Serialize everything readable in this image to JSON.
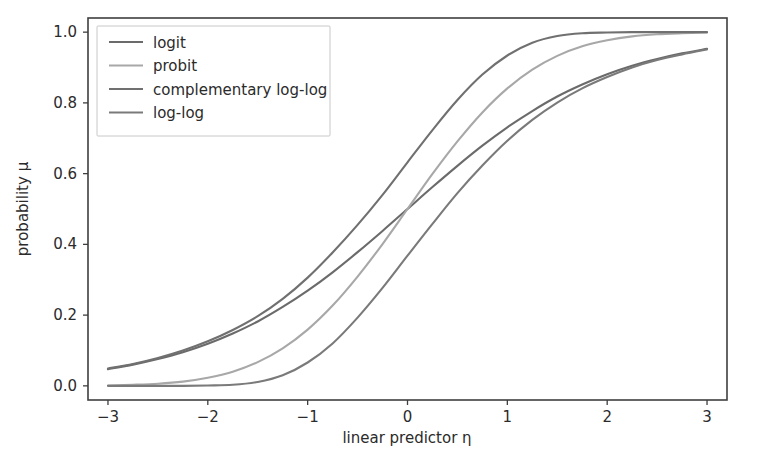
{
  "chart_data": {
    "type": "line",
    "title": "",
    "subtitle": "",
    "xlabel": "linear predictor η",
    "ylabel": "probability μ",
    "xlim": [
      -3.2,
      3.2
    ],
    "ylim": [
      -0.04,
      1.04
    ],
    "xticks": [
      -3,
      -2,
      -1,
      0,
      1,
      2,
      3
    ],
    "xticklabels": [
      "−3",
      "−2",
      "−1",
      "0",
      "1",
      "2",
      "3"
    ],
    "yticks": [
      0.0,
      0.2,
      0.4,
      0.6,
      0.8,
      1.0
    ],
    "yticklabels": [
      "0.0",
      "0.2",
      "0.4",
      "0.6",
      "0.8",
      "1.0"
    ],
    "grid": false,
    "legend_position": "upper left",
    "background": "#ffffff",
    "x": [
      -3.0,
      -2.75,
      -2.5,
      -2.25,
      -2.0,
      -1.75,
      -1.5,
      -1.25,
      -1.0,
      -0.75,
      -0.5,
      -0.25,
      0.0,
      0.25,
      0.5,
      0.75,
      1.0,
      1.25,
      1.5,
      1.75,
      2.0,
      2.25,
      2.5,
      2.75,
      3.0
    ],
    "series": [
      {
        "name": "logit",
        "color": "#6b6b6b",
        "link": "logit",
        "formula": "mu = 1 / (1 + exp(-eta))",
        "values": [
          0.047,
          0.06,
          0.076,
          0.095,
          0.119,
          0.148,
          0.182,
          0.223,
          0.269,
          0.321,
          0.378,
          0.438,
          0.5,
          0.562,
          0.622,
          0.679,
          0.731,
          0.777,
          0.818,
          0.852,
          0.881,
          0.905,
          0.924,
          0.94,
          0.953
        ]
      },
      {
        "name": "probit",
        "color": "#a8a8a8",
        "link": "probit",
        "formula": "mu = Phi(eta)",
        "values": [
          0.001,
          0.003,
          0.006,
          0.012,
          0.023,
          0.04,
          0.067,
          0.106,
          0.159,
          0.227,
          0.309,
          0.401,
          0.5,
          0.599,
          0.691,
          0.773,
          0.841,
          0.894,
          0.933,
          0.96,
          0.977,
          0.988,
          0.994,
          0.997,
          0.999
        ]
      },
      {
        "name": "complementary log-log",
        "color": "#707070",
        "link": "cloglog",
        "formula": "mu = 1 - exp(-exp(eta))",
        "values": [
          0.049,
          0.062,
          0.079,
          0.1,
          0.126,
          0.158,
          0.197,
          0.246,
          0.306,
          0.377,
          0.455,
          0.54,
          0.632,
          0.723,
          0.808,
          0.88,
          0.934,
          0.97,
          0.989,
          0.997,
          0.999,
          1.0,
          1.0,
          1.0,
          1.0
        ]
      },
      {
        "name": "log-log",
        "color": "#7a7a7a",
        "link": "loglog",
        "formula": "mu = exp(-exp(-eta))",
        "values": [
          0.0,
          0.0,
          0.0,
          0.0,
          0.001,
          0.003,
          0.011,
          0.03,
          0.066,
          0.12,
          0.193,
          0.277,
          0.368,
          0.458,
          0.545,
          0.623,
          0.693,
          0.752,
          0.801,
          0.841,
          0.873,
          0.9,
          0.921,
          0.937,
          0.951
        ]
      }
    ],
    "legend_entries": [
      "logit",
      "probit",
      "complementary log-log",
      "log-log"
    ],
    "annotations": []
  },
  "figure": {
    "background_color": "#ffffff",
    "axes_color": "#3f3f3f"
  }
}
